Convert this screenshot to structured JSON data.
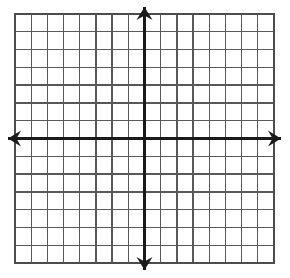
{
  "figure": {
    "title": "",
    "kind": "blank-coordinate-grid",
    "background_color": "#ffffff"
  },
  "chart_data": {
    "type": "scatter",
    "title": "",
    "subtitle": "",
    "xlabel": "",
    "ylabel": "",
    "x": [],
    "y": [],
    "series": [],
    "annotations": [],
    "legend": {
      "entries": [],
      "position": "none",
      "visible": false
    },
    "grid": {
      "visible": true,
      "columns": 16,
      "rows": 14,
      "cell_width_px": 16.2,
      "cell_height_px": 17.8,
      "line_color": "#595959",
      "line_width_px": 1.3,
      "border_color": "#4d4d4d",
      "border_width_px": 1.6
    },
    "axes": {
      "x_axis": {
        "visible": true,
        "label": "",
        "color": "#1a1a1a",
        "line_width_px": 3,
        "row_index_from_top": 7,
        "arrow_left": true,
        "arrow_right": true,
        "tick_labels": [],
        "xlim": [
          -8,
          8
        ]
      },
      "y_axis": {
        "visible": true,
        "label": "",
        "color": "#1a1a1a",
        "line_width_px": 3,
        "column_index_from_left": 8,
        "arrow_up": true,
        "arrow_down": true,
        "tick_labels": [],
        "ylim": [
          -7,
          7
        ]
      },
      "origin": {
        "x_px": 144.6,
        "y_px": 138.6,
        "label": ""
      }
    },
    "geometry": {
      "grid_left_px": 15,
      "grid_top_px": 14,
      "grid_right_px": 274,
      "grid_bottom_px": 263,
      "arrow_head_length_px": 13,
      "arrow_head_half_width_px": 8,
      "arrow_overshoot_px": 7
    }
  }
}
